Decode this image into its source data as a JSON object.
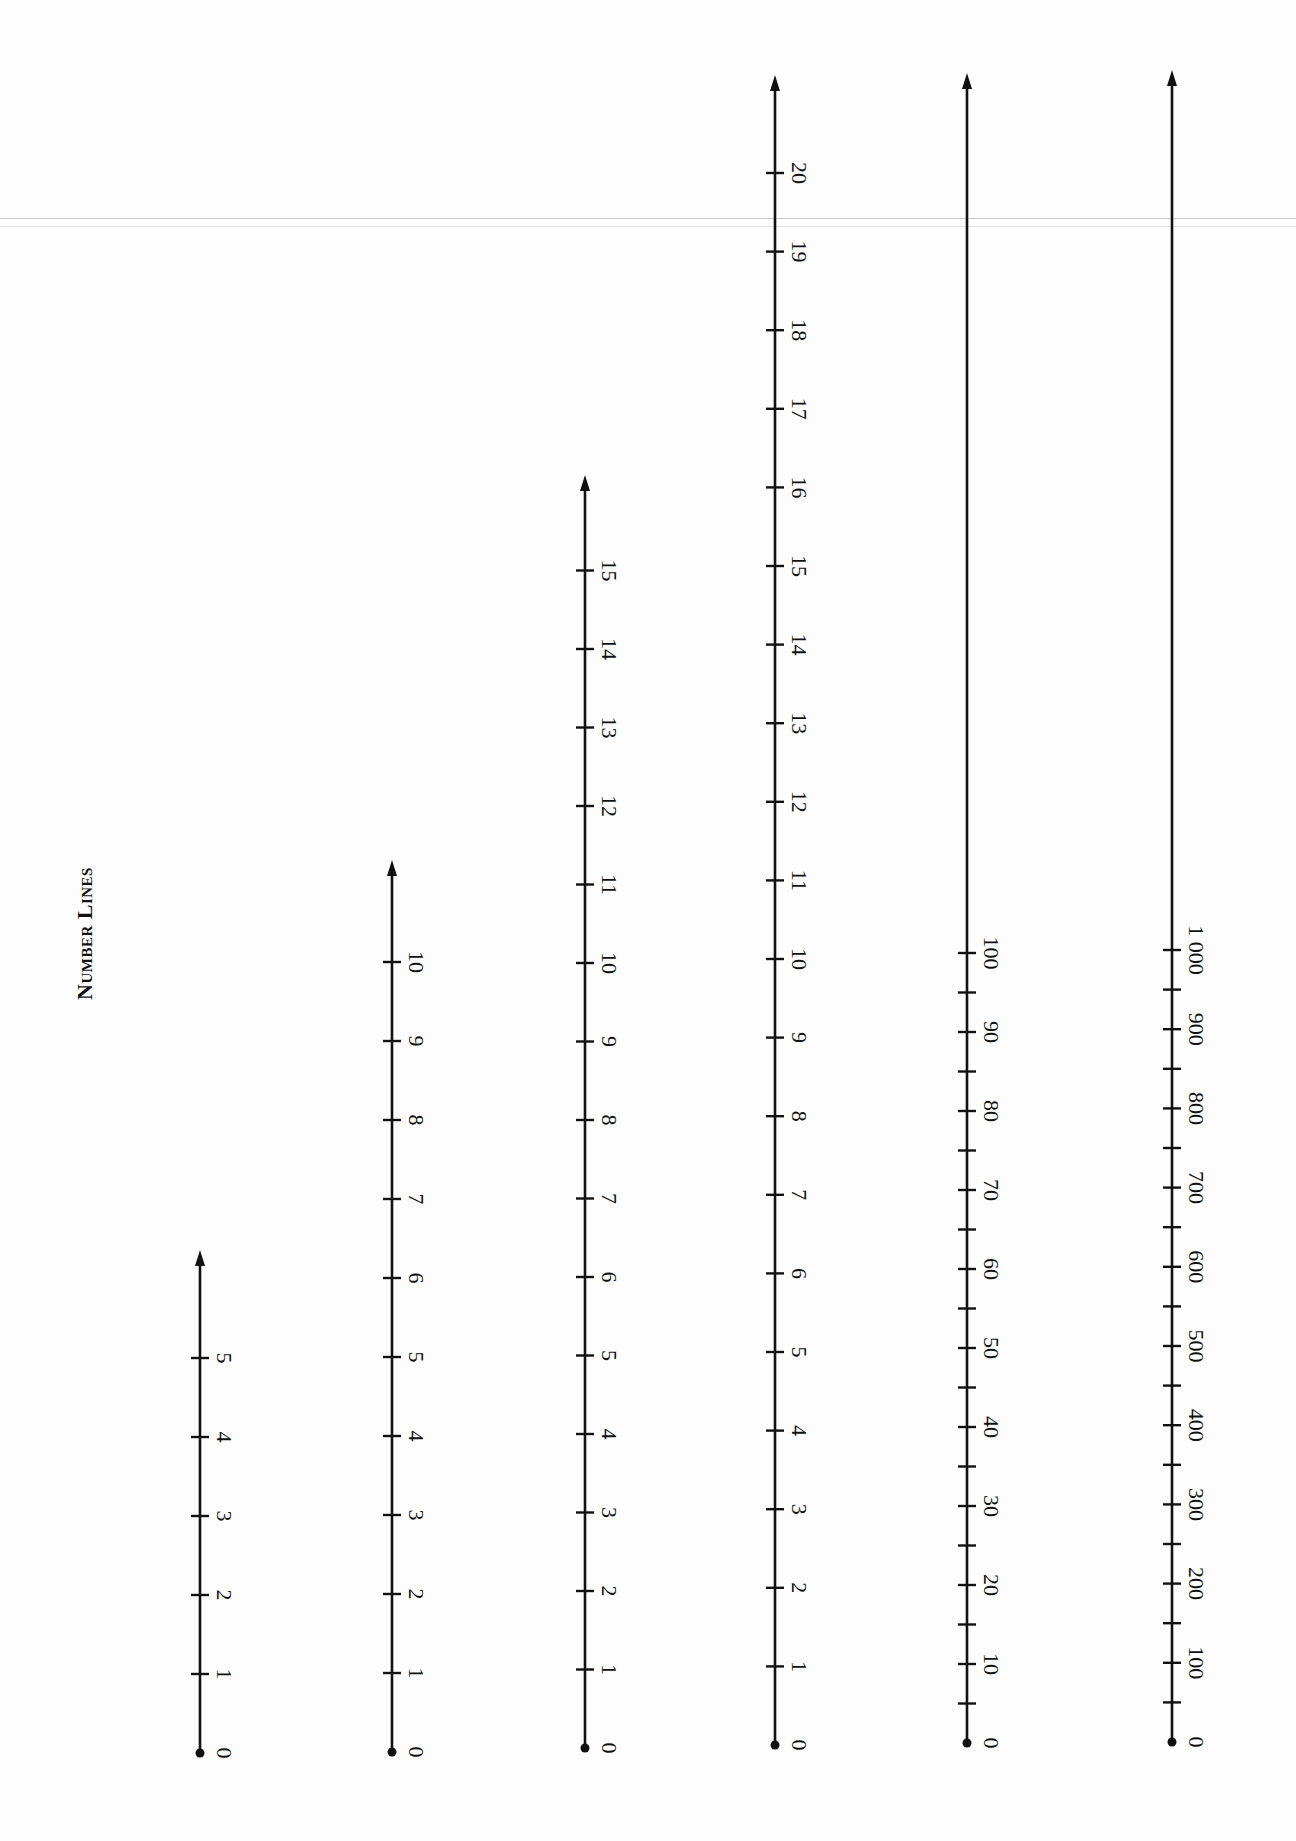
{
  "page": {
    "title": "Number Lines",
    "corner_text": "..."
  },
  "number_lines": [
    {
      "id": "line-0-5",
      "x": 200,
      "y0": 1753,
      "yArrow": 1250,
      "step": 79,
      "ticks": [
        0,
        1,
        2,
        3,
        4,
        5
      ],
      "labels": [
        "0",
        "1",
        "2",
        "3",
        "4",
        "5"
      ],
      "minor_ticks": false
    },
    {
      "id": "line-0-10",
      "x": 392,
      "y0": 1752,
      "yArrow": 860,
      "step": 79,
      "ticks": [
        0,
        1,
        2,
        3,
        4,
        5,
        6,
        7,
        8,
        9,
        10
      ],
      "labels": [
        "0",
        "1",
        "2",
        "3",
        "4",
        "5",
        "6",
        "7",
        "8",
        "9",
        "10"
      ],
      "minor_ticks": false
    },
    {
      "id": "line-0-15",
      "x": 585,
      "y0": 1748,
      "yArrow": 475,
      "step": 78.5,
      "ticks": [
        0,
        1,
        2,
        3,
        4,
        5,
        6,
        7,
        8,
        9,
        10,
        11,
        12,
        13,
        14,
        15
      ],
      "labels": [
        "0",
        "1",
        "2",
        "3",
        "4",
        "5",
        "6",
        "7",
        "8",
        "9",
        "10",
        "11",
        "12",
        "13",
        "14",
        "15"
      ],
      "minor_ticks": false
    },
    {
      "id": "line-0-20",
      "x": 775,
      "y0": 1745,
      "yArrow": 75,
      "step": 78.6,
      "ticks": [
        0,
        1,
        2,
        3,
        4,
        5,
        6,
        7,
        8,
        9,
        10,
        11,
        12,
        13,
        14,
        15,
        16,
        17,
        18,
        19,
        20
      ],
      "labels": [
        "0",
        "1",
        "2",
        "3",
        "4",
        "5",
        "6",
        "7",
        "8",
        "9",
        "10",
        "11",
        "12",
        "13",
        "14",
        "15",
        "16",
        "17",
        "18",
        "19",
        "20"
      ],
      "minor_ticks": false
    },
    {
      "id": "line-0-100",
      "x": 967,
      "y0": 1743,
      "yArrow": 73,
      "step": 79,
      "ticks": [
        0,
        10,
        20,
        30,
        40,
        50,
        60,
        70,
        80,
        90,
        100
      ],
      "labels": [
        "0",
        "10",
        "20",
        "30",
        "40",
        "50",
        "60",
        "70",
        "80",
        "90",
        "100"
      ],
      "minor_ticks": true
    },
    {
      "id": "line-0-1000",
      "x": 1172,
      "y0": 1742,
      "yArrow": 70,
      "step": 79.2,
      "ticks": [
        0,
        100,
        200,
        300,
        400,
        500,
        600,
        700,
        800,
        900,
        1000
      ],
      "labels": [
        "0",
        "100",
        "200",
        "300",
        "400",
        "500",
        "600",
        "700",
        "800",
        "900",
        "1 000"
      ],
      "minor_ticks": true
    }
  ],
  "chart_data": {
    "type": "number_lines",
    "title": "Number Lines",
    "lines": [
      {
        "range": [
          0,
          5
        ],
        "major_step": 1,
        "labels": [
          0,
          1,
          2,
          3,
          4,
          5
        ]
      },
      {
        "range": [
          0,
          10
        ],
        "major_step": 1,
        "labels": [
          0,
          1,
          2,
          3,
          4,
          5,
          6,
          7,
          8,
          9,
          10
        ]
      },
      {
        "range": [
          0,
          15
        ],
        "major_step": 1,
        "labels": [
          0,
          1,
          2,
          3,
          4,
          5,
          6,
          7,
          8,
          9,
          10,
          11,
          12,
          13,
          14,
          15
        ]
      },
      {
        "range": [
          0,
          20
        ],
        "major_step": 1,
        "labels": [
          0,
          1,
          2,
          3,
          4,
          5,
          6,
          7,
          8,
          9,
          10,
          11,
          12,
          13,
          14,
          15,
          16,
          17,
          18,
          19,
          20
        ]
      },
      {
        "range": [
          0,
          100
        ],
        "major_step": 10,
        "minor_step": 5,
        "labels": [
          0,
          10,
          20,
          30,
          40,
          50,
          60,
          70,
          80,
          90,
          100
        ]
      },
      {
        "range": [
          0,
          1000
        ],
        "major_step": 100,
        "minor_step": 50,
        "labels": [
          0,
          100,
          200,
          300,
          400,
          500,
          600,
          700,
          800,
          900,
          1000
        ]
      }
    ],
    "orientation": "vertical, labels rotated 90°, origin dot at bottom, arrow at top"
  }
}
